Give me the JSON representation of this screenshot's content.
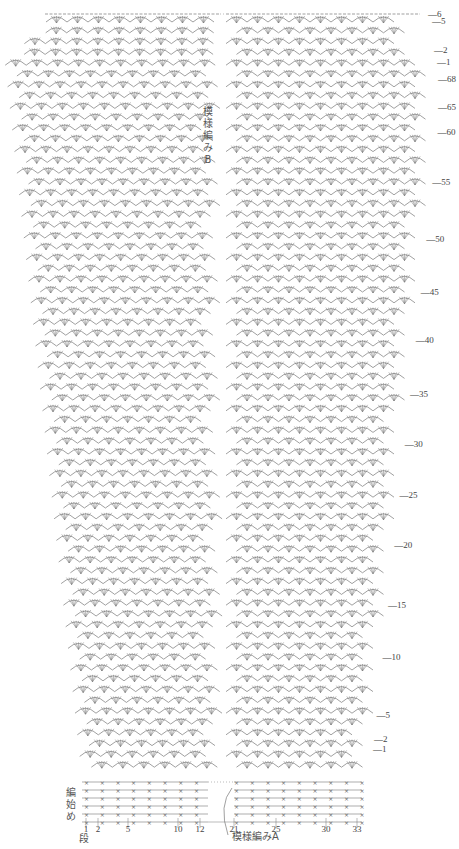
{
  "diagram": {
    "type": "crochet-chart",
    "pattern_labels": {
      "pattern_b": "模様編みB",
      "pattern_a": "模様編みA",
      "start": "編始め",
      "row_unit": "段"
    },
    "right_panel_top_rows": [
      "6",
      "5",
      "2",
      "1"
    ],
    "right_panel_main_rows": [
      "68",
      "65",
      "60",
      "55",
      "50",
      "45",
      "40",
      "35",
      "30",
      "25",
      "20",
      "15",
      "10",
      "5",
      "2",
      "1"
    ],
    "bottom_stitch_numbers_left": [
      "1",
      "2",
      "5",
      "10",
      "12"
    ],
    "bottom_stitch_numbers_right": [
      "21",
      "25",
      "30",
      "33"
    ],
    "colors": {
      "ink": "#6a6a6a",
      "background": "#ffffff"
    }
  }
}
